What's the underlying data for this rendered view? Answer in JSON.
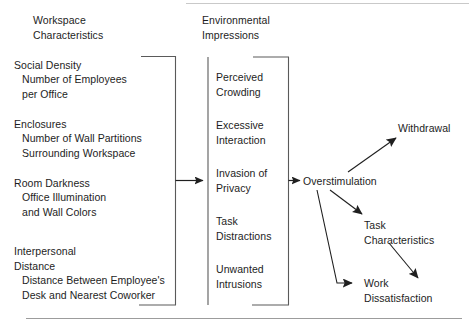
{
  "figure": {
    "type": "flow-diagram",
    "columns": {
      "left": {
        "header": "Workspace\nCharacteristics",
        "groups": [
          {
            "name": "Social Density",
            "detail": "Number of Employees\nper Office"
          },
          {
            "name": "Enclosures",
            "detail": "Number of Wall Partitions\nSurrounding Workspace"
          },
          {
            "name": "Room Darkness",
            "detail": "Office Illumination\nand Wall Colors"
          },
          {
            "name": "Interpersonal\nDistance",
            "detail": "Distance Between Employee's\nDesk and Nearest Coworker"
          }
        ]
      },
      "middle": {
        "header": "Environmental\nImpressions",
        "items": [
          "Perceived\nCrowding",
          "Excessive\nInteraction",
          "Invasion of\nPrivacy",
          "Task\nDistractions",
          "Unwanted\nIntrusions"
        ]
      },
      "right": {
        "hub": "Overstimulation",
        "outcomes": [
          "Withdrawal",
          "Task\nCharacteristics",
          "Work\nDissatisfaction"
        ]
      }
    },
    "colors": {
      "stroke": "#2a2a2a",
      "bracket": "#4a4a4a",
      "rule": "#9a9a9a",
      "text": "#1d1d1d",
      "background": "#ffffff"
    }
  }
}
